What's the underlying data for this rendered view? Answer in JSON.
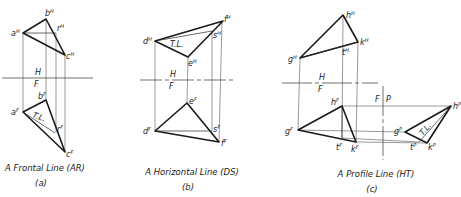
{
  "figure": {
    "panels": [
      {
        "id": "a",
        "caption": "A Frontal Line (AR)",
        "sublabel": "(a)",
        "fold_line": {
          "upper": "H",
          "lower": "F"
        },
        "true_length_mark": "T.L.",
        "points_H": {
          "a": "a",
          "b": "b",
          "c": "c",
          "r": "r",
          "sup": "H"
        },
        "points_F": {
          "a": "a",
          "b": "b",
          "c": "c",
          "r": "r",
          "sup": "F"
        }
      },
      {
        "id": "b",
        "caption": "A Horizontal Line (DS)",
        "sublabel": "(b)",
        "fold_line": {
          "upper": "H",
          "lower": "F"
        },
        "true_length_mark": "T.L.",
        "points_H": {
          "d": "d",
          "e": "e",
          "f": "f",
          "s": "s",
          "sup": "H"
        },
        "points_F": {
          "d": "d",
          "e": "e",
          "f": "f",
          "s": "s",
          "sup": "F"
        }
      },
      {
        "id": "c",
        "caption": "A Profile Line (HT)",
        "sublabel": "(c)",
        "fold_line": {
          "upper": "H",
          "lower": "F"
        },
        "fold_line_2": {
          "left": "F",
          "right": "P"
        },
        "true_length_mark": "T.L.",
        "points_H": {
          "g": "g",
          "h": "h",
          "k": "k",
          "t": "t",
          "sup": "H"
        },
        "points_F": {
          "g": "g",
          "h": "h",
          "k": "k",
          "t": "t",
          "sup": "F"
        },
        "points_P": {
          "g": "g",
          "h": "h",
          "k": "k",
          "t": "t",
          "sup": "P"
        }
      }
    ]
  }
}
